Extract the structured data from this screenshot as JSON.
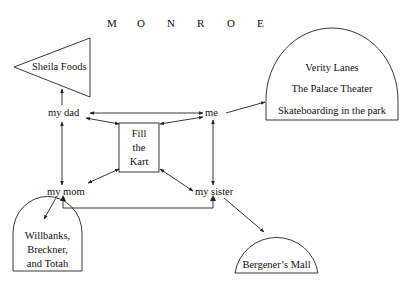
{
  "title": {
    "letters": [
      "M",
      "O",
      "N",
      "R",
      "O",
      "E"
    ]
  },
  "nodes": {
    "my_dad": "my dad",
    "me": "me",
    "my_mom": "my mom",
    "my_sister": "my sister",
    "center_box": [
      "Fill",
      "the",
      "Kart"
    ]
  },
  "places": {
    "sheila_foods": "Sheila Foods",
    "verity_group": [
      "Verity Lanes",
      "The Palace Theater",
      "Skateboarding in the park"
    ],
    "willbanks_group": [
      "Willbanks,",
      "Breckner,",
      "and Totah"
    ],
    "bergeners_mall": "Bergener’s Mall"
  },
  "colors": {
    "stroke": "#222222",
    "text": "#111111",
    "background": "#ffffff"
  }
}
